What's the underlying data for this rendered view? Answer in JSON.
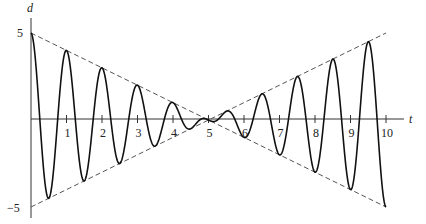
{
  "chart_data": {
    "type": "line",
    "title": "",
    "xlabel": "t",
    "ylabel": "d",
    "xlim": [
      0,
      10
    ],
    "ylim": [
      -5,
      5
    ],
    "x_ticks": [
      "1",
      "2",
      "3",
      "4",
      "5",
      "6",
      "7",
      "8",
      "9",
      "10"
    ],
    "y_ticks": [
      "5",
      "−5"
    ],
    "grid": false,
    "legend": null,
    "series": [
      {
        "name": "d(t) = (5 − t)·cos(2πt)",
        "style": "solid",
        "x": [
          0,
          0.5,
          1,
          1.5,
          2,
          2.5,
          3,
          3.5,
          4,
          4.5,
          5,
          5.5,
          6,
          6.5,
          7,
          7.5,
          8,
          8.5,
          9,
          9.5,
          10
        ],
        "values": [
          5,
          -4.5,
          4,
          -3.5,
          3,
          -2.5,
          2,
          -1.5,
          1,
          -0.5,
          0,
          0.5,
          -1,
          1.5,
          -2,
          2.5,
          -3,
          3.5,
          -4,
          4.5,
          -5
        ]
      },
      {
        "name": "envelope 5 − t",
        "style": "dashed",
        "x": [
          0,
          10
        ],
        "values": [
          5,
          -5
        ]
      },
      {
        "name": "envelope t − 5",
        "style": "dashed",
        "x": [
          0,
          10
        ],
        "values": [
          -5,
          5
        ]
      }
    ]
  },
  "axes": {
    "x_label": "t",
    "y_label": "d",
    "y_max_label": "5",
    "y_min_label": "−5"
  }
}
